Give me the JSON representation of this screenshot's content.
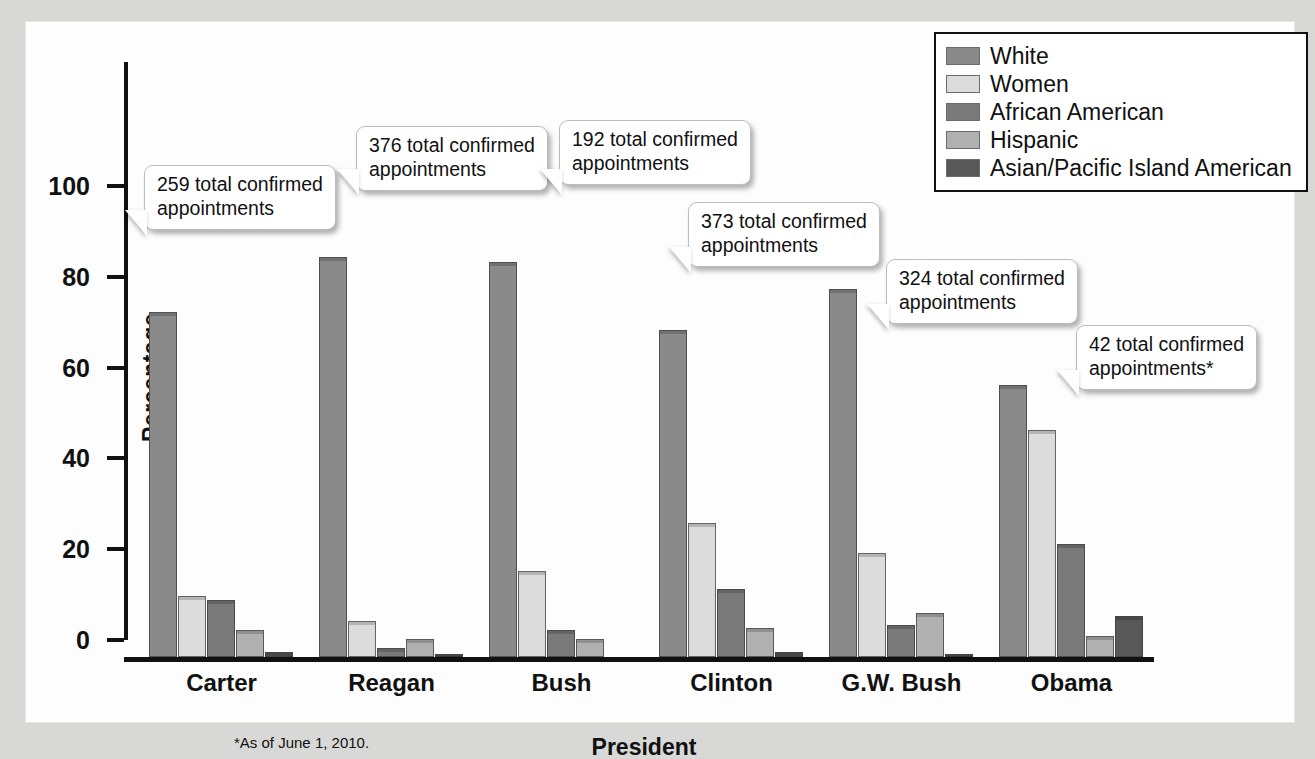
{
  "chart_data": {
    "type": "bar",
    "title": "",
    "xlabel": "President",
    "ylabel": "Percentage",
    "ylim": [
      0,
      115
    ],
    "yticks": [
      0,
      20,
      40,
      60,
      80,
      100
    ],
    "ytick_labels": [
      "0",
      "20",
      "40",
      "60",
      "80",
      "100"
    ],
    "grid": false,
    "legend_position": "top-right",
    "categories": [
      "Carter",
      "Reagan",
      "Bush",
      "Clinton",
      "G.W. Bush",
      "Obama"
    ],
    "series": [
      {
        "name": "White",
        "color": "#8a8a8a",
        "values": [
          76,
          88,
          87,
          72,
          81,
          60
        ]
      },
      {
        "name": "Women",
        "color": "#dcdcdc",
        "values": [
          13.5,
          8,
          19,
          29.5,
          23,
          50
        ]
      },
      {
        "name": "African American",
        "color": "#7a7a7a",
        "values": [
          12.5,
          2,
          6,
          15,
          7,
          25
        ]
      },
      {
        "name": "Hispanic",
        "color": "#b0b0b0",
        "values": [
          6,
          4,
          4,
          6.5,
          9.7,
          4.7
        ]
      },
      {
        "name": "Asian/Pacific Island American",
        "color": "#585858",
        "values": [
          1,
          0.7,
          0,
          1,
          0.7,
          9
        ]
      }
    ],
    "annotations": [
      {
        "text": "259 total confirmed\nappointments",
        "category": "Carter"
      },
      {
        "text": "376 total confirmed\nappointments",
        "category": "Reagan"
      },
      {
        "text": "192 total confirmed\nappointments",
        "category": "Bush"
      },
      {
        "text": "373 total confirmed\nappointments",
        "category": "Clinton"
      },
      {
        "text": "324 total confirmed\nappointments",
        "category": "G.W. Bush"
      },
      {
        "text": "42 total confirmed\nappointments*",
        "category": "Obama"
      }
    ],
    "footnote": "*As of June 1, 2010."
  }
}
